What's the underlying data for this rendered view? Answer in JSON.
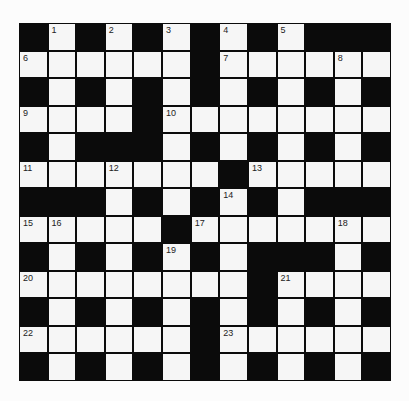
{
  "puzzle": {
    "rows": 13,
    "cols": 13,
    "colors": {
      "block": "#0b0b0b",
      "cell": "#f6f6f6",
      "number": "#222222",
      "background": "#fcfcfc"
    },
    "layout": [
      "#.#.#.#.#.###",
      "......#......",
      "#.#.#.#.#.#.#",
      "....#........",
      "#.###.#.#.#.#",
      ".......#.....",
      "###.#.#.#.###",
      ".....#.......",
      "#.#.#.#.###.#",
      "........#....",
      "#.#.#.#.#.#.#",
      "......#......",
      "#.#.#.#.#.#.#"
    ],
    "numbers": [
      {
        "n": "1",
        "r": 0,
        "c": 1
      },
      {
        "n": "2",
        "r": 0,
        "c": 3
      },
      {
        "n": "3",
        "r": 0,
        "c": 5
      },
      {
        "n": "4",
        "r": 0,
        "c": 7
      },
      {
        "n": "5",
        "r": 0,
        "c": 9
      },
      {
        "n": "6",
        "r": 1,
        "c": 0
      },
      {
        "n": "7",
        "r": 1,
        "c": 7
      },
      {
        "n": "8",
        "r": 1,
        "c": 11
      },
      {
        "n": "9",
        "r": 3,
        "c": 0
      },
      {
        "n": "10",
        "r": 3,
        "c": 5
      },
      {
        "n": "11",
        "r": 5,
        "c": 0
      },
      {
        "n": "12",
        "r": 5,
        "c": 3
      },
      {
        "n": "13",
        "r": 5,
        "c": 8
      },
      {
        "n": "14",
        "r": 6,
        "c": 7
      },
      {
        "n": "15",
        "r": 7,
        "c": 0
      },
      {
        "n": "16",
        "r": 7,
        "c": 1
      },
      {
        "n": "17",
        "r": 7,
        "c": 6
      },
      {
        "n": "18",
        "r": 7,
        "c": 11
      },
      {
        "n": "19",
        "r": 8,
        "c": 5
      },
      {
        "n": "20",
        "r": 9,
        "c": 0
      },
      {
        "n": "21",
        "r": 9,
        "c": 9
      },
      {
        "n": "22",
        "r": 11,
        "c": 0
      },
      {
        "n": "23",
        "r": 11,
        "c": 7
      }
    ],
    "letters": []
  }
}
